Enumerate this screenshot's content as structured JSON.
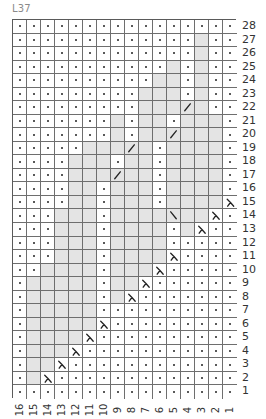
{
  "title": "L37",
  "legend_symbols": {
    ".": "purl-dot",
    "g": "knit-shaded",
    "L": "decrease-lambda",
    "/": "right-slant",
    "\\": "left-slant"
  },
  "colors": {
    "shaded": "#e4e4e4",
    "grid_line": "#6e6e6e",
    "symbol": "#222222",
    "label": "#333333",
    "title": "#8a8a8a"
  },
  "columns": [
    "16",
    "15",
    "14",
    "13",
    "12",
    "11",
    "10",
    "9",
    "8",
    "7",
    "6",
    "5",
    "4",
    "3",
    "2",
    "1"
  ],
  "rows": [
    {
      "label": "28",
      "cells": ". . . . . . . . . . . . . . . ."
    },
    {
      "label": "27",
      "cells": ". . . . . . . . . . . . . g . ."
    },
    {
      "label": "26",
      "cells": ". . . . . . . . . . . . . g . ."
    },
    {
      "label": "25",
      "cells": ". . . . . . . . . . . g . g . ."
    },
    {
      "label": "24",
      "cells": ". . . . . . . . . . g g . g . ."
    },
    {
      "label": "23",
      "cells": ". . . . . . . . . g g g . g . ."
    },
    {
      "label": "22",
      "cells": ". . . . . . . . . g g g / g . ."
    },
    {
      "label": "21",
      "cells": ". . . . . . . g . g g . g g g ."
    },
    {
      "label": "20",
      "cells": ". . . . . . . g . g g / g g g ."
    },
    {
      "label": "19",
      "cells": ". . . . . g g g / g . g g g g ."
    },
    {
      "label": "18",
      "cells": ". . . . g g g . g g . g g g g ."
    },
    {
      "label": "17",
      "cells": ". . . . g g g / g g . g g g g ."
    },
    {
      "label": "16",
      "cells": ". . . . g g . g g g . g g g g ."
    },
    {
      "label": "15",
      "cells": ". . . . g g . g g g . g g g g L"
    },
    {
      "label": "14",
      "cells": ". . . g g g . g g g g \\ g g L ."
    },
    {
      "label": "13",
      "cells": ". . . g g g . g g g g . g L . ."
    },
    {
      "label": "12",
      "cells": ". . . g g g . g g g g . . . . ."
    },
    {
      "label": "11",
      "cells": ". . . g g g . g g g g L . . . ."
    },
    {
      "label": "10",
      "cells": ". . g g g g . g g g L . . . . ."
    },
    {
      "label": "9",
      "cells": ". g g g g g . g g L . . . . . ."
    },
    {
      "label": "8",
      "cells": ". g g g g g . g L . . . . . . ."
    },
    {
      "label": "7",
      "cells": ". g g g g g . . . . . . . . . ."
    },
    {
      "label": "6",
      "cells": ". g g g g g L . . . . . . . . ."
    },
    {
      "label": "5",
      "cells": ". g g g g L . . . . . . . . . ."
    },
    {
      "label": "4",
      "cells": ". g g g L . . . . . . . . . . ."
    },
    {
      "label": "3",
      "cells": ". g g L . . . . . . . . . . . ."
    },
    {
      "label": "2",
      "cells": ". g L . . . . . . . . . . . . ."
    },
    {
      "label": "1",
      "cells": ". . . . . . . . . . . . . . . ."
    }
  ]
}
